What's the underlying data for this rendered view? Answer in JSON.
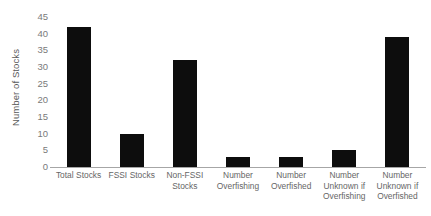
{
  "chart_data": {
    "type": "bar",
    "title": "",
    "xlabel": "",
    "ylabel": "Number of Stocks",
    "categories": [
      "Total Stocks",
      "FSSI Stocks",
      "Non-FSSI Stocks",
      "Number Overfishing",
      "Number Overfished",
      "Number Unknown if Overfishing",
      "Number Unknown if Overfished"
    ],
    "values": [
      42,
      10,
      32,
      3,
      3,
      5,
      39
    ],
    "ylim": [
      0,
      45
    ],
    "ytick_step": 5,
    "yticks": [
      "0",
      "5",
      "10",
      "15",
      "20",
      "25",
      "30",
      "35",
      "40",
      "45"
    ],
    "grid": false,
    "legend": false,
    "bar_color": "#0d0d0d",
    "axis_color": "#a6a6a6",
    "text_color": "#666666"
  }
}
